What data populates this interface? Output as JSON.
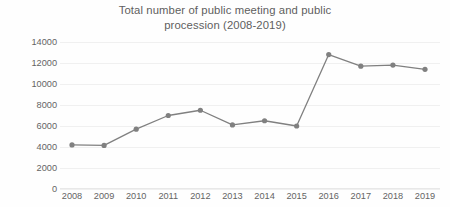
{
  "chart_data": {
    "type": "line",
    "title": "Total number of public meeting and public procession (2008-2019)",
    "title_line1": "Total number of public meeting and public",
    "title_line2": "procession (2008-2019)",
    "xlabel": "",
    "ylabel": "",
    "categories": [
      "2008",
      "2009",
      "2010",
      "2011",
      "2012",
      "2013",
      "2014",
      "2015",
      "2016",
      "2017",
      "2018",
      "2019"
    ],
    "values": [
      4200,
      4150,
      5700,
      7000,
      7500,
      6100,
      6500,
      6000,
      12800,
      11700,
      11800,
      11400
    ],
    "series": [
      {
        "name": "Total number of public meeting and public procession",
        "values": [
          4200,
          4150,
          5700,
          7000,
          7500,
          6100,
          6500,
          6000,
          12800,
          11700,
          11800,
          11400
        ]
      }
    ],
    "ylim": [
      0,
      14000
    ],
    "ytick_values": [
      14000,
      12000,
      10000,
      8000,
      6000,
      4000,
      2000,
      0
    ],
    "ytick_labels": [
      "14000",
      "12000",
      "10000",
      "8000",
      "6000",
      "4000",
      "2000",
      "0"
    ],
    "grid": true,
    "grid_axis": "y",
    "legend": false,
    "legend_position": "none",
    "line_color": "#808080",
    "marker_color": "#808080",
    "marker_shape": "circle",
    "background_color": "#ffffff",
    "text_color": "#595959"
  }
}
